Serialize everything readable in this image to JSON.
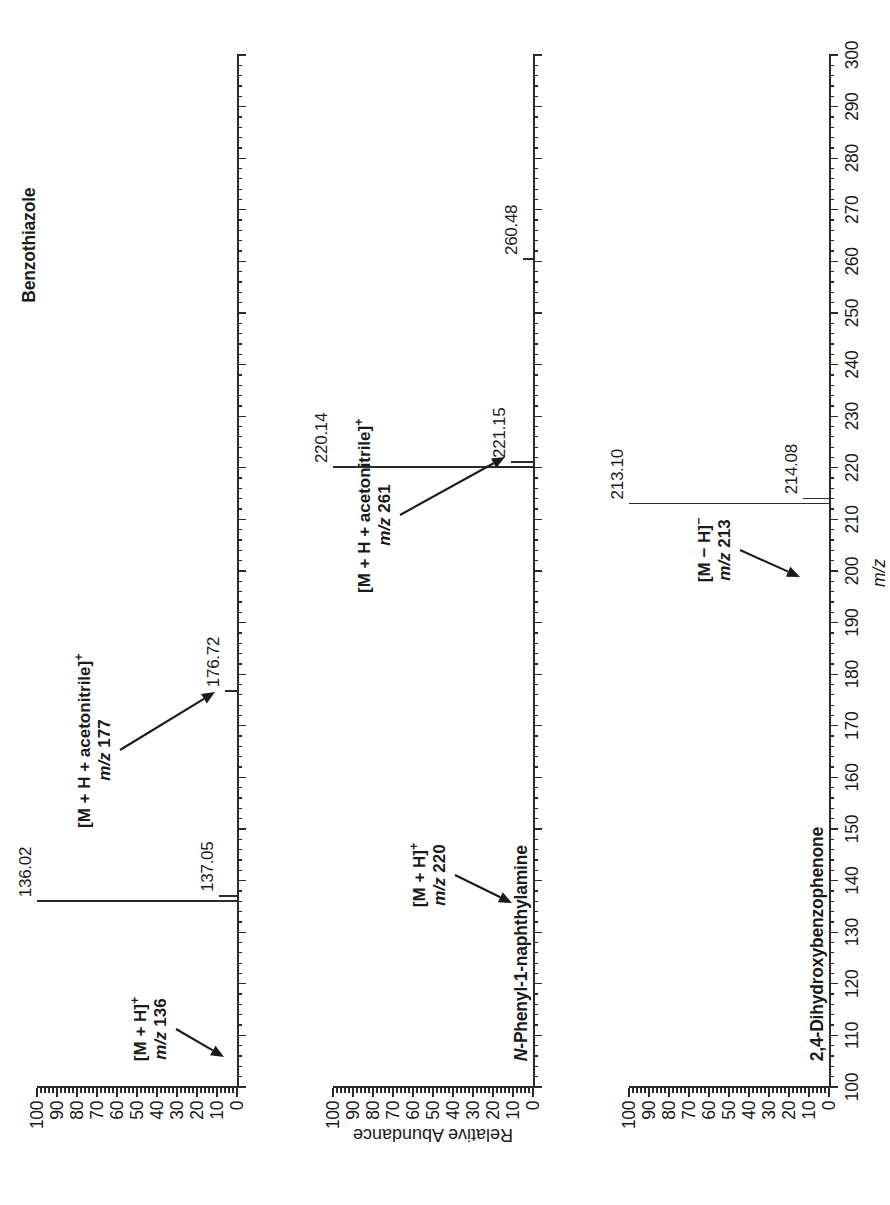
{
  "figure": {
    "kind": "mass-spectra-stack",
    "orientation": "rotated-90-ccw",
    "axis_title_x": "m/z",
    "axis_title_y": "Relative Abundance"
  },
  "axes": {
    "x": {
      "label": "m/z",
      "min": 100,
      "max": 300,
      "major_step": 10,
      "minor_step": 2,
      "ticklabels": [
        "100",
        "110",
        "120",
        "130",
        "140",
        "150",
        "160",
        "170",
        "180",
        "190",
        "200",
        "210",
        "220",
        "230",
        "240",
        "250",
        "260",
        "270",
        "280",
        "290",
        "300"
      ]
    },
    "y": {
      "label": "Relative Abundance",
      "min": 0,
      "max": 100,
      "major_step": 10,
      "minor_step": 2,
      "ticklabels": [
        "0",
        "10",
        "20",
        "30",
        "40",
        "50",
        "60",
        "70",
        "80",
        "90",
        "100"
      ]
    }
  },
  "panels": [
    {
      "id": "panel-benzothiazole",
      "compound": "Benzothiazole",
      "compound_italic_prefix": "",
      "annotations": [
        {
          "id": "ann-136",
          "line1_html": "[M + H]<sup>+</sup>",
          "line2_html": "<i>m/z</i> 136",
          "line1": "[M + H]+",
          "line2": "m/z 136"
        },
        {
          "id": "ann-177",
          "line1_html": "[M + H + acetonitrile]<sup>+</sup>",
          "line2_html": "<i>m/z</i> 177",
          "line1": "[M + H + acetonitrile]+",
          "line2": "m/z 177"
        }
      ],
      "peaks": [
        {
          "mz": 136.02,
          "label": "136.02",
          "intensity": 100
        },
        {
          "mz": 137.05,
          "label": "137.05",
          "intensity": 9
        },
        {
          "mz": 176.72,
          "label": "176.72",
          "intensity": 6
        }
      ]
    },
    {
      "id": "panel-n-phenyl-1-naphthylamine",
      "compound": "N-Phenyl-1-naphthylamine",
      "compound_italic_prefix": "N",
      "annotations": [
        {
          "id": "ann-220",
          "line1_html": "[M + H]<sup>+</sup>",
          "line2_html": "<i>m/z</i> 220",
          "line1": "[M + H]+",
          "line2": "m/z 220"
        },
        {
          "id": "ann-261",
          "line1_html": "[M + H + acetonitrile]<sup>+</sup>",
          "line2_html": "<i>m/z</i> 261",
          "line1": "[M + H + acetonitrile]+",
          "line2": "m/z 261"
        }
      ],
      "peaks": [
        {
          "mz": 220.14,
          "label": "220.14",
          "intensity": 100
        },
        {
          "mz": 221.15,
          "label": "221.15",
          "intensity": 11
        },
        {
          "mz": 260.48,
          "label": "260.48",
          "intensity": 5
        }
      ]
    },
    {
      "id": "panel-2-4-dihydroxybenzophenone",
      "compound": "2,4-Dihydroxybenzophenone",
      "compound_italic_prefix": "",
      "annotations": [
        {
          "id": "ann-213",
          "line1_html": "[M &#8722; H]<sup>&#8722;</sup>",
          "line2_html": "<i>m/z</i> 213",
          "line1": "[M - H]-",
          "line2": "m/z 213"
        }
      ],
      "peaks": [
        {
          "mz": 213.1,
          "label": "213.10",
          "intensity": 100
        },
        {
          "mz": 214.08,
          "label": "214.08",
          "intensity": 13
        }
      ]
    }
  ],
  "chart_data": {
    "type": "line",
    "title": "",
    "xlabel": "m/z",
    "ylabel": "Relative Abundance",
    "xlim": [
      100,
      300
    ],
    "ylim": [
      0,
      100
    ],
    "grid": false,
    "legend": "none",
    "series": [
      {
        "name": "Benzothiazole",
        "x": [
          136.02,
          137.05,
          176.72
        ],
        "values": [
          100,
          9,
          6
        ],
        "labels": [
          "136.02",
          "137.05",
          "176.72"
        ],
        "annotations": [
          "[M + H]+ m/z 136",
          "[M + H + acetonitrile]+ m/z 177"
        ]
      },
      {
        "name": "N-Phenyl-1-naphthylamine",
        "x": [
          220.14,
          221.15,
          260.48
        ],
        "values": [
          100,
          11,
          5
        ],
        "labels": [
          "220.14",
          "221.15",
          "260.48"
        ],
        "annotations": [
          "[M + H]+ m/z 220",
          "[M + H + acetonitrile]+ m/z 261"
        ]
      },
      {
        "name": "2,4-Dihydroxybenzophenone",
        "x": [
          213.1,
          214.08
        ],
        "values": [
          100,
          13
        ],
        "labels": [
          "213.10",
          "214.08"
        ],
        "annotations": [
          "[M - H]- m/z 213"
        ]
      }
    ]
  },
  "colors": {
    "ink": "#1a1a1a",
    "line": "#2b2b2b",
    "background": "#ffffff"
  }
}
